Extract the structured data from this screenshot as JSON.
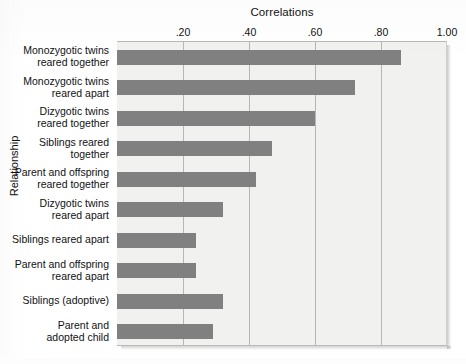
{
  "chart_data": {
    "type": "bar",
    "orientation": "horizontal",
    "title": "Correlations",
    "xlabel": "Correlations",
    "ylabel": "Relationship",
    "xlim": [
      0.0,
      1.0
    ],
    "xticks": [
      0.2,
      0.4,
      0.6,
      0.8,
      1.0
    ],
    "xtick_labels": [
      ".20",
      ".40",
      ".60",
      ".80",
      "1.00"
    ],
    "grid": "vertical",
    "legend": "none",
    "bar_color": "#808080",
    "plot_background": "#f1f1f0",
    "categories": [
      "Monozygotic twins reared together",
      "Monozygotic twins reared apart",
      "Dizygotic twins reared together",
      "Siblings reared together",
      "Parent and offspring reared together",
      "Dizygotic twins reared apart",
      "Siblings reared apart",
      "Parent and offspring reared apart",
      "Siblings (adoptive)",
      "Parent and adopted child"
    ],
    "category_lines": [
      [
        "Monozygotic twins",
        "reared together"
      ],
      [
        "Monozygotic twins",
        "reared apart"
      ],
      [
        "Dizygotic twins",
        "reared together"
      ],
      [
        "Siblings reared",
        "together"
      ],
      [
        "Parent and offspring",
        "reared together"
      ],
      [
        "Dizygotic twins",
        "reared apart"
      ],
      [
        "Siblings reared apart"
      ],
      [
        "Parent and offspring",
        "reared apart"
      ],
      [
        "Siblings (adoptive)"
      ],
      [
        "Parent and",
        "adopted child"
      ]
    ],
    "values": [
      0.86,
      0.72,
      0.6,
      0.47,
      0.42,
      0.32,
      0.24,
      0.24,
      0.32,
      0.29
    ]
  }
}
